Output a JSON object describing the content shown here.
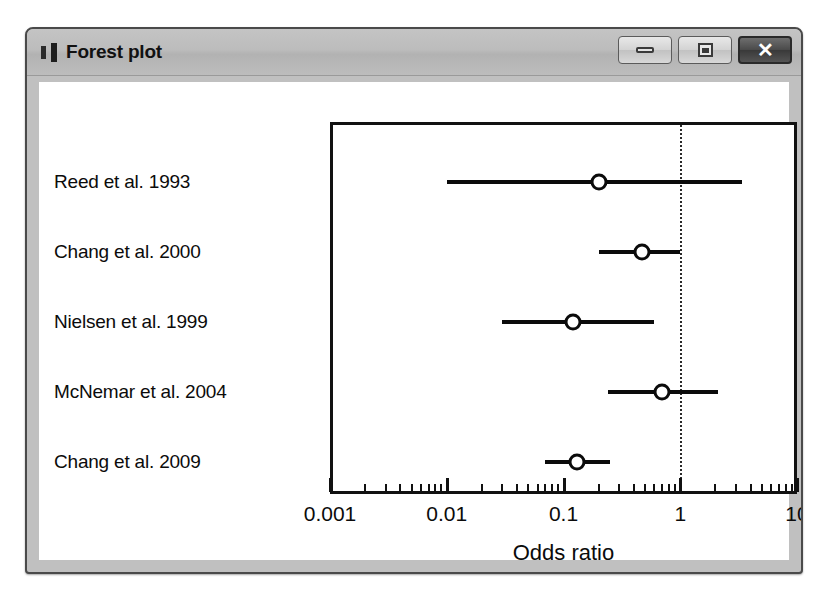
{
  "window": {
    "title": "Forest plot",
    "icon": "window-bars-icon",
    "controls": {
      "minimize_label": "–",
      "maximize_label": "□",
      "close_label": "✕"
    }
  },
  "colors": {
    "titlebar": "#bcbcbc",
    "window_border": "#4a4a4a",
    "plot_ink": "#0b0b0b",
    "client_background": "#ffffff",
    "close_button": "#3a3a3a"
  },
  "chart_data": {
    "type": "forest",
    "title": "Forest plot",
    "xlabel": "Odds ratio",
    "ylabel": "",
    "xscale": "log",
    "xlim": [
      0.001,
      10
    ],
    "grid": false,
    "reference_line": 1,
    "tick_labels": [
      "0.001",
      "0.01",
      "0.1",
      "1",
      "10"
    ],
    "tick_values": [
      0.001,
      0.01,
      0.1,
      1,
      10
    ],
    "studies": [
      {
        "label": "Reed et al. 1993",
        "or": 0.2,
        "ci_low": 0.01,
        "ci_high": 3.4
      },
      {
        "label": "Chang et al. 2000",
        "or": 0.47,
        "ci_low": 0.2,
        "ci_high": 1.0
      },
      {
        "label": "Nielsen et al. 1999",
        "or": 0.12,
        "ci_low": 0.03,
        "ci_high": 0.6
      },
      {
        "label": "McNemar et al. 2004",
        "or": 0.7,
        "ci_low": 0.24,
        "ci_high": 2.1
      },
      {
        "label": "Chang et al. 2009",
        "or": 0.13,
        "ci_low": 0.07,
        "ci_high": 0.25
      }
    ]
  }
}
